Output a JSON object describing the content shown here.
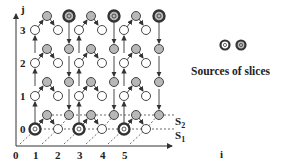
{
  "diagram": {
    "axes": {
      "y_label": "j",
      "x_label": "i",
      "y_ticks": [
        "3",
        "2",
        "1",
        "0"
      ],
      "x_ticks": [
        "0",
        "1",
        "2",
        "3",
        "4",
        "5"
      ]
    },
    "slice_labels": {
      "s2": "S",
      "s2_sub": "2",
      "s1": "S",
      "s1_sub": "1"
    },
    "legend": {
      "text": "Sources of slices"
    },
    "colors": {
      "gray_node": "#b8b8b8",
      "source_ring": "#444444",
      "line": "#333333"
    }
  }
}
